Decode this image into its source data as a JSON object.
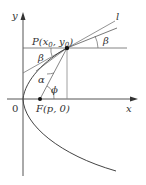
{
  "diagram": {
    "axes": {
      "x_label": "x",
      "y_label": "y",
      "origin_label": "0"
    },
    "points": {
      "P": {
        "label": "P(x",
        "sub0": "0",
        "mid": ", y",
        "sub1": "0",
        "end": ")"
      },
      "F": {
        "label": "F(p, 0)"
      }
    },
    "line_label": "l",
    "angles": {
      "beta_top": "β",
      "beta_left": "β",
      "alpha": "α",
      "phi": "ϕ"
    },
    "colors": {
      "line": "#555555",
      "curve": "#444444",
      "text": "#333333"
    }
  }
}
